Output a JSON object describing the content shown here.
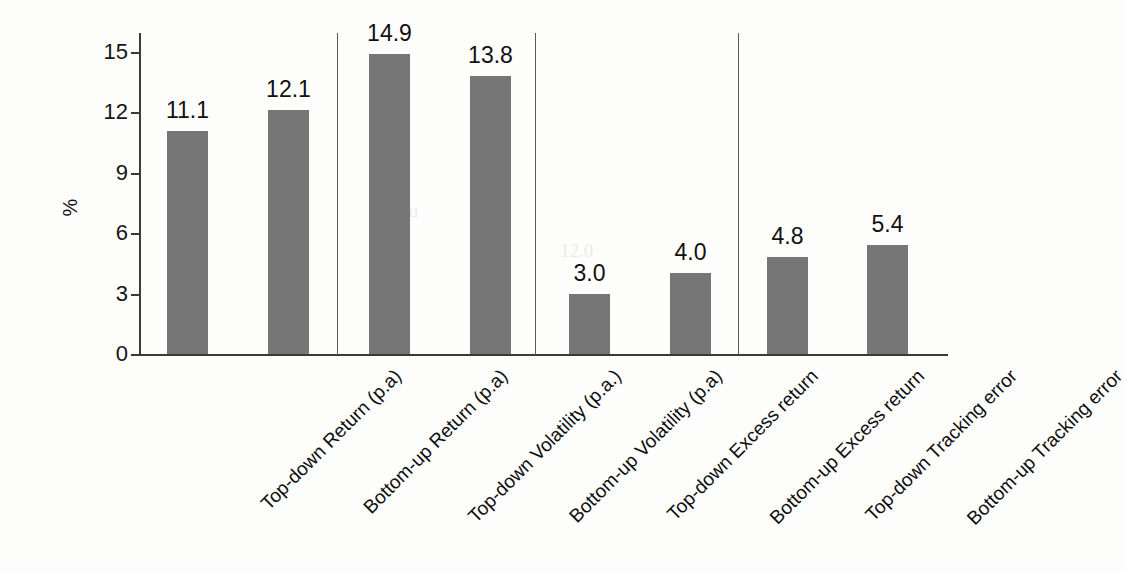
{
  "chart_data": {
    "type": "bar",
    "title": "",
    "xlabel": "",
    "ylabel": "%",
    "ylim": [
      0,
      16.5
    ],
    "yticks": [
      0,
      3,
      6,
      9,
      12,
      15
    ],
    "grid": false,
    "legend": "none",
    "bar_color": "#767676",
    "axis_color": "#3a3a3a",
    "categories": [
      "Top-down Return (p.a)",
      "Bottom-up Return (p.a)",
      "Top-down Volatility (p.a.)",
      "Bottom-up Volatility (p.a)",
      "Top-down Excess return",
      "Bottom-up Excess return",
      "Top-down Tracking error",
      "Bottom-up Tracking error"
    ],
    "values": [
      11.1,
      12.1,
      14.9,
      13.8,
      3.0,
      4.0,
      4.8,
      5.4
    ],
    "value_labels": [
      "11.1",
      "12.1",
      "14.9",
      "13.8",
      "3.0",
      "4.0",
      "4.8",
      "5.4"
    ],
    "groups": [
      {
        "name": "Return (p.a)",
        "categories": [
          0,
          1
        ]
      },
      {
        "name": "Volatility (p.a)",
        "categories": [
          2,
          3
        ]
      },
      {
        "name": "Excess return",
        "categories": [
          4,
          5
        ]
      },
      {
        "name": "Tracking error",
        "categories": [
          6,
          7
        ]
      }
    ],
    "group_separators": 3
  },
  "ticks": {
    "t0": "0",
    "t3": "3",
    "t6": "6",
    "t9": "9",
    "t12": "12",
    "t15": "15"
  },
  "axis": {
    "y_label": "%"
  }
}
